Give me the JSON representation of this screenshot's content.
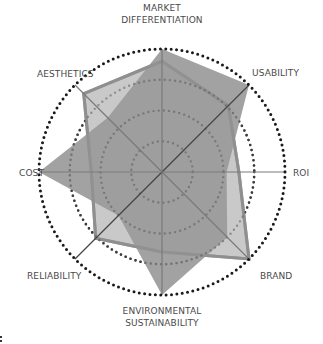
{
  "chart_data": {
    "type": "radar",
    "title": "",
    "axes": [
      "MARKET DIFFERENTIATION",
      "USABILITY",
      "ROI",
      "BRAND",
      "ENVIRONMENTAL SUSTAINABILITY",
      "RELIABILITY",
      "COST",
      "AESTHETICS"
    ],
    "axis_label_lines": [
      [
        "MARKET",
        "DIFFERENTIATION"
      ],
      [
        "USABILITY"
      ],
      [
        "ROI"
      ],
      [
        "BRAND"
      ],
      [
        "ENVIRONMENTAL",
        "SUSTAINABILITY"
      ],
      [
        "RELIABILITY"
      ],
      [
        "COST"
      ],
      [
        "AESTHETICS"
      ]
    ],
    "rlim": [
      0,
      4
    ],
    "rings": [
      1,
      2,
      3,
      4
    ],
    "grid": "dotted concentric circles",
    "legend": "none",
    "series": [
      {
        "name": "Series A (light, outlined)",
        "values": [
          3.6,
          3.05,
          2.5,
          4.0,
          2.6,
          3.05,
          2.3,
          3.6
        ],
        "fill": "#c9c9c9",
        "stroke": "#8f8f8f"
      },
      {
        "name": "Series B (dark)",
        "values": [
          4.0,
          4.0,
          2.1,
          3.0,
          4.0,
          2.0,
          4.0,
          2.5
        ],
        "fill": "#9a9a9a",
        "stroke": "none"
      }
    ]
  },
  "colors": {
    "ring": "#1a1a1a",
    "axis_line": "#7a7a7a",
    "axis_line_dark": "#444444",
    "label": "#4a4a4a"
  }
}
